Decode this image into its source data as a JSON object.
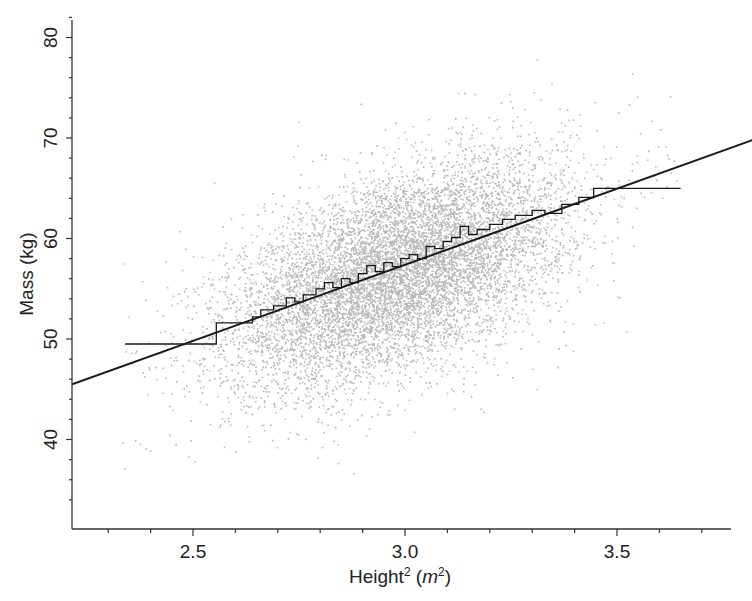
{
  "chart_data": {
    "type": "scatter",
    "title": "",
    "xlabel": "Height",
    "xlabel_sup": "2",
    "xlabel_unit_open": " (",
    "xlabel_unit": "m",
    "xlabel_unit_sup": "2",
    "xlabel_unit_close": ")",
    "ylabel": "Mass (kg)",
    "xlim": [
      2.215,
      3.77
    ],
    "ylim": [
      31.1,
      81.5
    ],
    "xticks": [
      2.5,
      3.0,
      3.5
    ],
    "xtick_labels": [
      "2.5",
      "3.0",
      "3.5"
    ],
    "xminor_step": 0.1,
    "yticks": [
      40,
      50,
      60,
      70,
      80
    ],
    "ytick_labels": [
      "40",
      "50",
      "60",
      "70",
      "80"
    ],
    "yminor_step": 2,
    "grid": false,
    "legend": null,
    "point_color": "#b9b9b9",
    "line_color": "#1a1a1a",
    "scatter_cloud": {
      "description": "dense cloud of individual (height^2, mass) observations",
      "approx_count": 20000,
      "center": [
        2.98,
        56.6
      ],
      "sd_x": 0.2,
      "sd_y": 5.6,
      "correlation": 0.52,
      "x_range": [
        2.33,
        3.66
      ],
      "y_range": [
        35,
        78
      ]
    },
    "regression_line": {
      "label": "linear fit",
      "slope": 15.2,
      "intercept": 11.8,
      "points": [
        [
          2.215,
          45.5
        ],
        [
          3.82,
          69.8
        ]
      ]
    },
    "binned_means_step": {
      "label": "binned mean mass",
      "points": [
        [
          2.34,
          49.5
        ],
        [
          2.555,
          49.5
        ],
        [
          2.555,
          51.6
        ],
        [
          2.64,
          51.6
        ],
        [
          2.64,
          52.2
        ],
        [
          2.66,
          52.2
        ],
        [
          2.66,
          52.9
        ],
        [
          2.69,
          52.9
        ],
        [
          2.69,
          53.3
        ],
        [
          2.72,
          53.3
        ],
        [
          2.72,
          54.1
        ],
        [
          2.74,
          54.1
        ],
        [
          2.74,
          53.7
        ],
        [
          2.76,
          53.7
        ],
        [
          2.76,
          54.4
        ],
        [
          2.79,
          54.4
        ],
        [
          2.79,
          55.0
        ],
        [
          2.81,
          55.0
        ],
        [
          2.81,
          55.6
        ],
        [
          2.83,
          55.6
        ],
        [
          2.83,
          55.1
        ],
        [
          2.85,
          55.1
        ],
        [
          2.85,
          56.0
        ],
        [
          2.87,
          56.0
        ],
        [
          2.87,
          55.6
        ],
        [
          2.89,
          55.6
        ],
        [
          2.89,
          56.5
        ],
        [
          2.91,
          56.5
        ],
        [
          2.91,
          57.3
        ],
        [
          2.93,
          57.3
        ],
        [
          2.93,
          56.7
        ],
        [
          2.95,
          56.7
        ],
        [
          2.95,
          57.6
        ],
        [
          2.97,
          57.6
        ],
        [
          2.97,
          57.2
        ],
        [
          2.99,
          57.2
        ],
        [
          2.99,
          58.0
        ],
        [
          3.01,
          58.0
        ],
        [
          3.01,
          58.4
        ],
        [
          3.03,
          58.4
        ],
        [
          3.03,
          58.0
        ],
        [
          3.05,
          58.0
        ],
        [
          3.05,
          59.2
        ],
        [
          3.07,
          59.2
        ],
        [
          3.07,
          59.0
        ],
        [
          3.09,
          59.0
        ],
        [
          3.09,
          59.7
        ],
        [
          3.11,
          59.7
        ],
        [
          3.11,
          60.1
        ],
        [
          3.13,
          60.1
        ],
        [
          3.13,
          61.2
        ],
        [
          3.15,
          61.2
        ],
        [
          3.15,
          60.4
        ],
        [
          3.17,
          60.4
        ],
        [
          3.17,
          60.9
        ],
        [
          3.2,
          60.9
        ],
        [
          3.2,
          61.4
        ],
        [
          3.23,
          61.4
        ],
        [
          3.23,
          61.9
        ],
        [
          3.26,
          61.9
        ],
        [
          3.26,
          62.3
        ],
        [
          3.3,
          62.3
        ],
        [
          3.3,
          62.8
        ],
        [
          3.33,
          62.8
        ],
        [
          3.33,
          62.5
        ],
        [
          3.37,
          62.5
        ],
        [
          3.37,
          63.4
        ],
        [
          3.41,
          63.4
        ],
        [
          3.41,
          64.1
        ],
        [
          3.445,
          64.1
        ],
        [
          3.445,
          65.0
        ],
        [
          3.65,
          65.0
        ]
      ]
    },
    "plot_px": {
      "x_origin_px": 193,
      "x_origin_val": 2.5,
      "x_px_per_unit": 424,
      "y_origin_px": 339,
      "y_origin_val": 50,
      "y_px_per_unit": 10.05,
      "left": 72,
      "right": 731,
      "top": 20,
      "bottom": 529
    }
  }
}
